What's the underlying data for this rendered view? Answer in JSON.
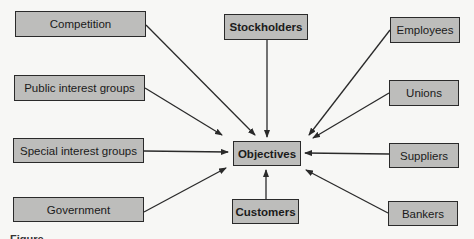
{
  "diagram": {
    "center": {
      "label": "Objectives"
    },
    "nodes": {
      "competition": {
        "label": "Competition"
      },
      "stockholders": {
        "label": "Stockholders"
      },
      "employees": {
        "label": "Employees"
      },
      "public_interest_groups": {
        "label": "Public interest groups"
      },
      "unions": {
        "label": "Unions"
      },
      "special_interest_groups": {
        "label": "Special interest groups"
      },
      "suppliers": {
        "label": "Suppliers"
      },
      "government": {
        "label": "Government"
      },
      "customers": {
        "label": "Customers"
      },
      "bankers": {
        "label": "Bankers"
      }
    },
    "edges": [
      {
        "from": "Competition",
        "to": "Objectives"
      },
      {
        "from": "Stockholders",
        "to": "Objectives"
      },
      {
        "from": "Employees",
        "to": "Objectives"
      },
      {
        "from": "Public interest groups",
        "to": "Objectives"
      },
      {
        "from": "Unions",
        "to": "Objectives"
      },
      {
        "from": "Special interest groups",
        "to": "Objectives"
      },
      {
        "from": "Suppliers",
        "to": "Objectives"
      },
      {
        "from": "Government",
        "to": "Objectives"
      },
      {
        "from": "Customers",
        "to": "Objectives"
      },
      {
        "from": "Bankers",
        "to": "Objectives"
      }
    ],
    "colors": {
      "box_fill": "#bdbdbb",
      "stroke": "#2a2a2a",
      "background": "#f7f7f5"
    }
  },
  "caption": {
    "text": "Figure"
  }
}
